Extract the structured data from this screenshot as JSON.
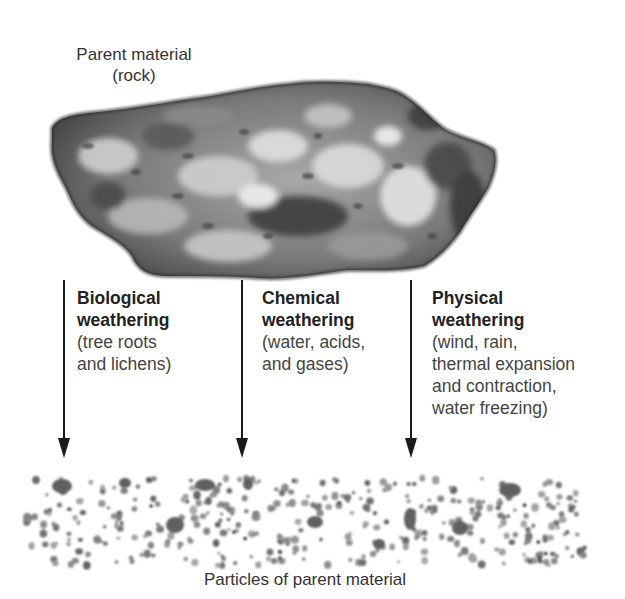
{
  "parent_material": {
    "title_line1": "Parent material",
    "title_line2": "(rock)"
  },
  "processes": [
    {
      "heading_line1": "Biological",
      "heading_line2": "weathering",
      "desc_lines": [
        "(tree roots",
        "and lichens)"
      ]
    },
    {
      "heading_line1": "Chemical",
      "heading_line2": "weathering",
      "desc_lines": [
        "(water, acids,",
        "and gases)"
      ]
    },
    {
      "heading_line1": "Physical",
      "heading_line2": "weathering",
      "desc_lines": [
        "(wind, rain,",
        "thermal expansion",
        "and contraction,",
        "water freezing)"
      ]
    }
  ],
  "particles": {
    "caption": "Particles of parent material"
  },
  "colors": {
    "arrow": "#1a1a1a",
    "rock_dark": "#3a3a3a",
    "rock_light": "#bdbdbd",
    "particle": "#7a7a7a"
  }
}
